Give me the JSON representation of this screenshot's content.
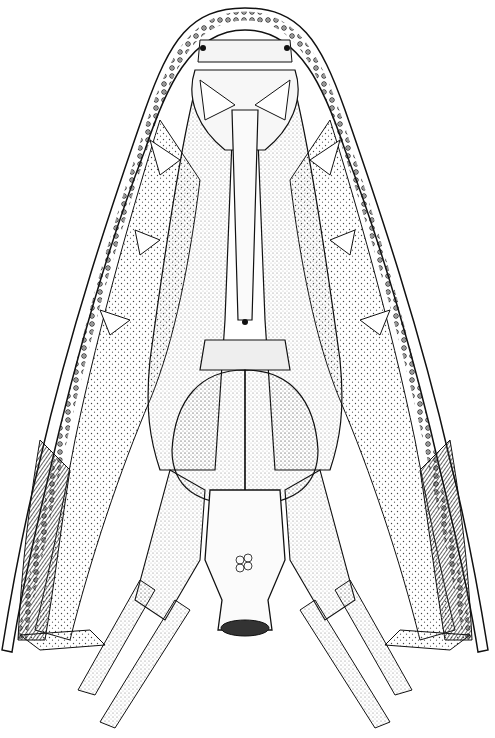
{
  "illustration": {
    "subject": "Ventral view of a fossil vertebrate skull (palate and branchial skeleton), pen-and-ink stipple drawing",
    "colors": {
      "ink": "#111111",
      "paper": "#ffffff",
      "stipple": "#555555",
      "shade": "#2a2a2a"
    },
    "parts": [
      "outer-jaw-margin",
      "marginal-teeth-row",
      "premaxillary-region",
      "parasphenoid",
      "pterygoid-left",
      "pterygoid-right",
      "palatal-fangs",
      "basibranchial-plates",
      "hyoid-bar",
      "ceratobranchials",
      "branchial-rays",
      "quadrate-regions"
    ]
  }
}
